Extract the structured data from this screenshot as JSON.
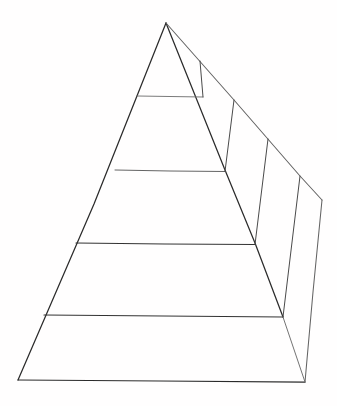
{
  "document": {
    "title": "Hand-drawn Pyramid Diagram",
    "medium": "pencil-on-paper sketch",
    "background_color": "#fffefe",
    "ink_color": "#2b2b2b",
    "faint_ink_color": "#8c8c8c",
    "label_color": "#cfcfcf",
    "width": 337,
    "height": 406
  },
  "diagram": {
    "type": "three-dimensional-pyramid",
    "tier_count": 4,
    "orientation": "apex-up, viewed from front-left with right side face visible",
    "tiers": [
      {
        "index": 1,
        "position": "apex",
        "label": "",
        "label_x": 166,
        "label_y": 80
      },
      {
        "index": 2,
        "position": "upper-middle",
        "label": "",
        "label_x": 164,
        "label_y": 209
      },
      {
        "index": 3,
        "position": "lower-middle",
        "label": "",
        "label_x": 161,
        "label_y": 279
      },
      {
        "index": 4,
        "position": "base",
        "label": "",
        "label_x": 160,
        "label_y": 354
      }
    ],
    "vertices": {
      "apex": [
        166,
        23
      ],
      "front_bottom_left": [
        18,
        380
      ],
      "front_bottom_right": [
        283,
        317
      ],
      "back_bottom_right": [
        305,
        382
      ],
      "back_right_top": [
        322,
        200
      ]
    },
    "front_face_dividers": [
      {
        "y": 96,
        "x_start": 137,
        "x_end": 203
      },
      {
        "y": 170,
        "x_start": 115,
        "x_end": 225
      },
      {
        "y": 243,
        "x_start": 76,
        "x_end": 255
      },
      {
        "y": 315,
        "x_start": 44,
        "x_end": 283
      }
    ],
    "side_face_ridge_points": [
      [
        200,
        61
      ],
      [
        234,
        100
      ],
      [
        268,
        139
      ],
      [
        300,
        176
      ]
    ]
  }
}
